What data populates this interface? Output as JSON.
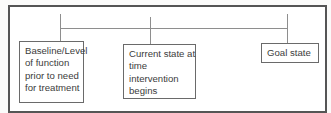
{
  "diagram": {
    "type": "timeline",
    "colors": {
      "frame_border": "#555555",
      "connector": "#8e8e8e",
      "box_border": "#6a6a6a",
      "text": "#3c3c3c",
      "background": "#ffffff"
    },
    "nodes": [
      {
        "id": "baseline",
        "label": "Baseline/Level of function prior to need for treatment",
        "lines": [
          "Baseline/Level",
          "of function",
          "prior to need",
          "for treatment"
        ]
      },
      {
        "id": "current",
        "label": "Current state at time intervention begins",
        "lines": [
          "Current state at",
          "time",
          "intervention",
          "begins"
        ]
      },
      {
        "id": "goal",
        "label": "Goal state",
        "lines": [
          "Goal state"
        ]
      }
    ],
    "edges": [
      {
        "from": "baseline",
        "to": "current"
      },
      {
        "from": "current",
        "to": "goal"
      }
    ]
  }
}
